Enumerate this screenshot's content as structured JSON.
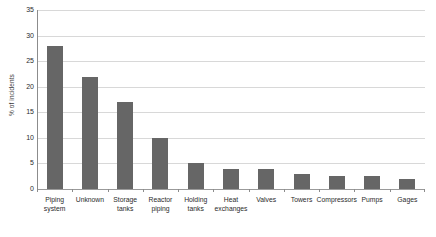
{
  "chart_data": {
    "type": "bar",
    "title": "",
    "xlabel": "",
    "ylabel": "% of incidents",
    "ylim": [
      0,
      35
    ],
    "yticks": [
      0,
      5,
      10,
      15,
      20,
      25,
      30,
      35
    ],
    "grid": true,
    "legend": "none",
    "bar_color": "#666666",
    "gridline_color": "#d8d8d8",
    "axis_color": "#8c8c8c",
    "categories": [
      "Piping\nsystem",
      "Unknown",
      "Storage\ntanks",
      "Reactor\npiping",
      "Holding\ntanks",
      "Heat\nexchanges",
      "Valves",
      "Towers",
      "Compressors",
      "Pumps",
      "Gages"
    ],
    "values": [
      28,
      22,
      17,
      10,
      5,
      4,
      4,
      3,
      2.6,
      2.6,
      2
    ]
  }
}
